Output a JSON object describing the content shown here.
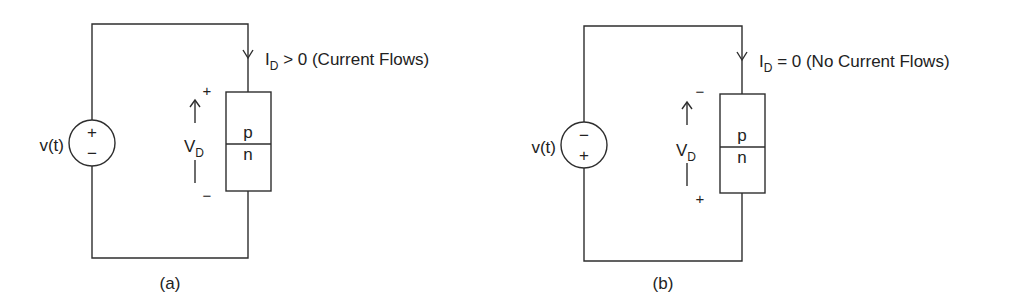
{
  "figure": {
    "line_color": "#2e2e2e",
    "text_color": "#222222"
  },
  "circuits": [
    {
      "id": "a",
      "caption": "(a)",
      "source": {
        "label": "v(t)",
        "top_sign": "+",
        "bottom_sign": "−"
      },
      "current": {
        "symbol": "I",
        "subscript": "D",
        "relation": " > 0 (Current Flows)"
      },
      "voltage": {
        "symbol": "V",
        "subscript": "D",
        "top_sign": "+",
        "bottom_sign": "−"
      },
      "diode": {
        "top_region": "p",
        "bottom_region": "n"
      }
    },
    {
      "id": "b",
      "caption": "(b)",
      "source": {
        "label": "v(t)",
        "top_sign": "−",
        "bottom_sign": "+"
      },
      "current": {
        "symbol": "I",
        "subscript": "D",
        "relation": " = 0 (No Current Flows)"
      },
      "voltage": {
        "symbol": "V",
        "subscript": "D",
        "top_sign": "−",
        "bottom_sign": "+"
      },
      "diode": {
        "top_region": "p",
        "bottom_region": "n"
      }
    }
  ]
}
